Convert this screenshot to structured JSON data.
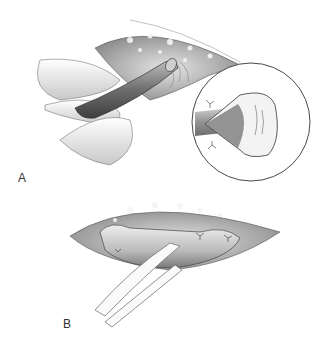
{
  "figure": {
    "panels": [
      {
        "id": "A",
        "label": "A",
        "description": "Vessel exposed in incision, held by fingers; inset circle shows spatulated vessel end"
      },
      {
        "id": "B",
        "label": "B",
        "description": "Vessel loop passed around vessel within incision, secured with sutures"
      }
    ],
    "colors": {
      "background": "#ffffff",
      "line": "#333333",
      "tissue_dark": "#5a5a5a",
      "tissue_mid": "#9a9a9a",
      "tissue_light": "#d8d8d8"
    }
  }
}
